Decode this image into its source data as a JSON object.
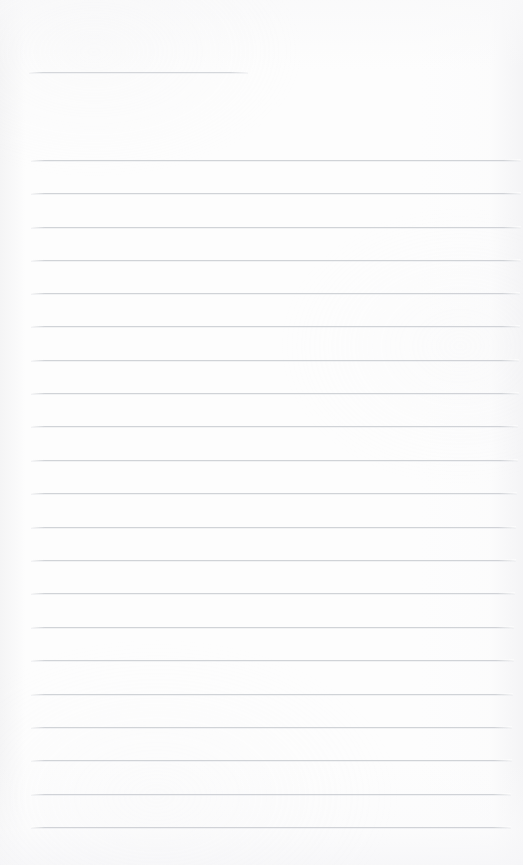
{
  "page": {
    "kind": "ruled-notepad-page",
    "width": 523,
    "height": 865,
    "background_color": "#fdfdfd",
    "rule_color": "#c9ccd1",
    "content_text": "",
    "is_blank": true
  },
  "header_rule": {
    "name": "header-rule",
    "x": 29,
    "y": 72,
    "width": 219,
    "color": "#cbced3"
  },
  "rules": [
    {
      "index": 1,
      "y": 160,
      "x": 31,
      "width": 490
    },
    {
      "index": 2,
      "y": 193,
      "x": 31,
      "width": 490
    },
    {
      "index": 3,
      "y": 227,
      "x": 31,
      "width": 490
    },
    {
      "index": 4,
      "y": 260,
      "x": 31,
      "width": 490
    },
    {
      "index": 5,
      "y": 293,
      "x": 31,
      "width": 489
    },
    {
      "index": 6,
      "y": 326,
      "x": 31,
      "width": 489
    },
    {
      "index": 7,
      "y": 360,
      "x": 31,
      "width": 488
    },
    {
      "index": 8,
      "y": 393,
      "x": 31,
      "width": 488
    },
    {
      "index": 9,
      "y": 426,
      "x": 31,
      "width": 487
    },
    {
      "index": 10,
      "y": 460,
      "x": 31,
      "width": 487
    },
    {
      "index": 11,
      "y": 493,
      "x": 31,
      "width": 486
    },
    {
      "index": 12,
      "y": 527,
      "x": 31,
      "width": 485
    },
    {
      "index": 13,
      "y": 560,
      "x": 31,
      "width": 485
    },
    {
      "index": 14,
      "y": 593,
      "x": 31,
      "width": 484
    },
    {
      "index": 15,
      "y": 627,
      "x": 31,
      "width": 483
    },
    {
      "index": 16,
      "y": 660,
      "x": 31,
      "width": 483
    },
    {
      "index": 17,
      "y": 694,
      "x": 31,
      "width": 482
    },
    {
      "index": 18,
      "y": 727,
      "x": 31,
      "width": 481
    },
    {
      "index": 19,
      "y": 760,
      "x": 31,
      "width": 481
    },
    {
      "index": 20,
      "y": 794,
      "x": 31,
      "width": 480
    },
    {
      "index": 21,
      "y": 827,
      "x": 31,
      "width": 480
    }
  ]
}
